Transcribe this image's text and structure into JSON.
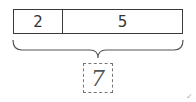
{
  "diagram": {
    "type": "tape-diagram",
    "parts": [
      {
        "label": "2"
      },
      {
        "label": "5"
      }
    ],
    "total": {
      "label": "7"
    },
    "mark": "✓",
    "colors": {
      "line": "#3a3a3a",
      "dashed": "#777777",
      "text": "#333333"
    }
  }
}
